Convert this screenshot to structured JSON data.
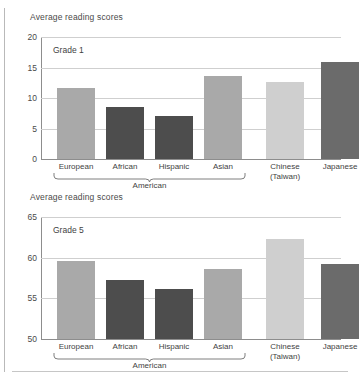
{
  "figure": {
    "background": "#ffffff",
    "axis_color": "#8d8d8d",
    "grid_color": "#cfcfcf",
    "text_color": "#3f3f3f"
  },
  "palette": {
    "european": "#a9a9a9",
    "african": "#4d4d4d",
    "hispanic": "#4d4d4d",
    "asian": "#a9a9a9",
    "chinese": "#cfcfcf",
    "japanese": "#6b6b6b"
  },
  "panels": [
    {
      "title": "Average reading scores",
      "grade_label": "Grade 1",
      "yticks": [
        "20",
        "15",
        "10",
        "5",
        "0"
      ],
      "group_label": "American",
      "xlabels": [
        {
          "line1": "European",
          "line2": ""
        },
        {
          "line1": "African",
          "line2": ""
        },
        {
          "line1": "Hispanic",
          "line2": ""
        },
        {
          "line1": "Asian",
          "line2": ""
        },
        {
          "line1": "Chinese",
          "line2": "(Taiwan)"
        },
        {
          "line1": "Japanese",
          "line2": ""
        }
      ]
    },
    {
      "title": "Average reading scores",
      "grade_label": "Grade 5",
      "yticks": [
        "65",
        "60",
        "55",
        "50"
      ],
      "group_label": "American",
      "xlabels": [
        {
          "line1": "European",
          "line2": ""
        },
        {
          "line1": "African",
          "line2": ""
        },
        {
          "line1": "Hispanic",
          "line2": ""
        },
        {
          "line1": "Asian",
          "line2": ""
        },
        {
          "line1": "Chinese",
          "line2": "(Taiwan)"
        },
        {
          "line1": "Japanese",
          "line2": ""
        }
      ]
    }
  ],
  "chart_data": [
    {
      "type": "bar",
      "title": "Average reading scores",
      "annotation": "Grade 1",
      "xlabel": "",
      "ylabel": "Average reading scores",
      "categories": [
        "European American",
        "African American",
        "Hispanic American",
        "Asian American",
        "Chinese (Taiwan)",
        "Japanese"
      ],
      "values": [
        11.7,
        8.5,
        7.1,
        13.6,
        12.7,
        15.9
      ],
      "bar_colors": [
        "#a9a9a9",
        "#4d4d4d",
        "#4d4d4d",
        "#a9a9a9",
        "#cfcfcf",
        "#6b6b6b"
      ],
      "ylim": [
        0,
        20
      ],
      "yticks": [
        0,
        5,
        10,
        15,
        20
      ],
      "grid": true,
      "legend": "none",
      "group_bracket": {
        "label": "American",
        "covers": [
          "European American",
          "African American",
          "Hispanic American",
          "Asian American"
        ]
      }
    },
    {
      "type": "bar",
      "title": "Average reading scores",
      "annotation": "Grade 5",
      "xlabel": "",
      "ylabel": "Average reading scores",
      "categories": [
        "European American",
        "African American",
        "Hispanic American",
        "Asian American",
        "Chinese (Taiwan)",
        "Japanese"
      ],
      "values": [
        59.6,
        57.2,
        56.1,
        58.6,
        62.3,
        59.2
      ],
      "bar_colors": [
        "#a9a9a9",
        "#4d4d4d",
        "#4d4d4d",
        "#a9a9a9",
        "#cfcfcf",
        "#6b6b6b"
      ],
      "ylim": [
        50,
        65
      ],
      "yticks": [
        50,
        55,
        60,
        65
      ],
      "grid": true,
      "legend": "none",
      "group_bracket": {
        "label": "American",
        "covers": [
          "European American",
          "African American",
          "Hispanic American",
          "Asian American"
        ]
      }
    }
  ]
}
